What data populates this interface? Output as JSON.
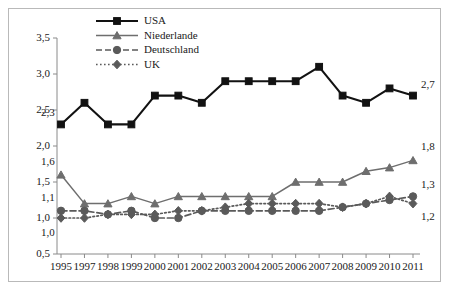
{
  "chart_data": {
    "type": "line",
    "title": "",
    "subtitle": "",
    "xlabel": "",
    "ylabel": "",
    "grid": false,
    "legend_position": "top-center",
    "categories": [
      "1995",
      "1997",
      "1998",
      "1999",
      "2000",
      "2001",
      "2002",
      "2003",
      "2004",
      "2005",
      "2006",
      "2007",
      "2008",
      "2009",
      "2010",
      "2011"
    ],
    "x": [
      "1995",
      "1997",
      "1998",
      "1999",
      "2000",
      "2001",
      "2002",
      "2003",
      "2004",
      "2005",
      "2006",
      "2007",
      "2008",
      "2009",
      "2010",
      "2011"
    ],
    "ylim": [
      0.5,
      3.5
    ],
    "ytick_labels": [
      "0,5",
      "1,0",
      "1,5",
      "2,0",
      "2,5",
      "3,0",
      "3,5"
    ],
    "ytick_values": [
      0.5,
      1.0,
      1.5,
      2.0,
      2.5,
      3.0,
      3.5
    ],
    "series": [
      {
        "name": "USA",
        "color": "#121212",
        "marker": "square",
        "line_style": "solid",
        "values": [
          2.3,
          2.6,
          2.3,
          2.3,
          2.7,
          2.7,
          2.6,
          2.9,
          2.9,
          2.9,
          2.9,
          3.1,
          2.7,
          2.6,
          2.8,
          2.7
        ]
      },
      {
        "name": "Niederlande",
        "color": "#6e6e6e",
        "marker": "triangle",
        "line_style": "solid",
        "values": [
          1.6,
          1.2,
          1.2,
          1.3,
          1.2,
          1.3,
          1.3,
          1.3,
          1.3,
          1.3,
          1.5,
          1.5,
          1.5,
          1.65,
          1.7,
          1.8
        ]
      },
      {
        "name": "Deutschland",
        "color": "#5a5a5a",
        "marker": "circle",
        "line_style": "dashed",
        "values": [
          1.1,
          1.1,
          1.05,
          1.1,
          1.0,
          1.0,
          1.1,
          1.1,
          1.1,
          1.1,
          1.1,
          1.1,
          1.15,
          1.2,
          1.25,
          1.3
        ]
      },
      {
        "name": "UK",
        "color": "#5a5a5a",
        "marker": "diamond",
        "line_style": "dotted",
        "values": [
          1.0,
          1.0,
          1.05,
          1.05,
          1.05,
          1.1,
          1.1,
          1.15,
          1.2,
          1.2,
          1.2,
          1.2,
          1.15,
          1.2,
          1.3,
          1.2
        ]
      }
    ],
    "annotations": [
      {
        "text": "2,3",
        "series": "USA",
        "side": "start"
      },
      {
        "text": "2,7",
        "series": "USA",
        "side": "end"
      },
      {
        "text": "1,6",
        "series": "Niederlande",
        "side": "start"
      },
      {
        "text": "1,8",
        "series": "Niederlande",
        "side": "end"
      },
      {
        "text": "1,1",
        "series": "Deutschland",
        "side": "start"
      },
      {
        "text": "1,3",
        "series": "Deutschland",
        "side": "end"
      },
      {
        "text": "1,0",
        "series": "UK",
        "side": "start"
      },
      {
        "text": "1,2",
        "series": "UK",
        "side": "end"
      }
    ]
  },
  "legend": {
    "items": [
      {
        "label": "USA"
      },
      {
        "label": "Niederlande"
      },
      {
        "label": "Deutschland"
      },
      {
        "label": "UK"
      }
    ]
  },
  "axis": {
    "y_labels": [
      "3,5",
      "3,0",
      "2,5",
      "2,0",
      "1,5",
      "1,0",
      "0,5"
    ],
    "x_labels": [
      "1995",
      "1997",
      "1998",
      "1999",
      "2000",
      "2001",
      "2002",
      "2003",
      "2004",
      "2005",
      "2006",
      "2007",
      "2008",
      "2009",
      "2010",
      "2011"
    ]
  },
  "annotations_left": {
    "usa": "2,3",
    "niederlande": "1,6",
    "deutschland": "1,1",
    "uk": "1,0"
  },
  "annotations_right": {
    "usa": "2,7",
    "niederlande": "1,8",
    "deutschland": "1,3",
    "uk": "1,2"
  }
}
